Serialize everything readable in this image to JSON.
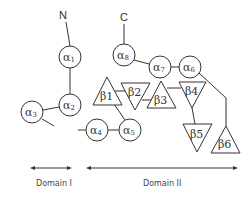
{
  "diagram": {
    "type": "protein-topology",
    "termini": {
      "n": "N",
      "c": "C"
    },
    "helices": [
      {
        "id": "a1",
        "label": "α",
        "sub": "1",
        "cx": 70,
        "cy": 57
      },
      {
        "id": "a2",
        "label": "α",
        "sub": "2",
        "cx": 70,
        "cy": 105
      },
      {
        "id": "a3",
        "label": "α",
        "sub": "3",
        "cx": 32,
        "cy": 112
      },
      {
        "id": "a4",
        "label": "α",
        "sub": "4",
        "cx": 97,
        "cy": 130
      },
      {
        "id": "a5",
        "label": "α",
        "sub": "5",
        "cx": 130,
        "cy": 130
      },
      {
        "id": "a6",
        "label": "α",
        "sub": "6",
        "cx": 190,
        "cy": 67
      },
      {
        "id": "a7",
        "label": "α",
        "sub": "7",
        "cx": 160,
        "cy": 67
      },
      {
        "id": "a8",
        "label": "α",
        "sub": "8",
        "cx": 124,
        "cy": 55
      }
    ],
    "strands": [
      {
        "id": "b1",
        "label": "β1",
        "direction": "up"
      },
      {
        "id": "b2",
        "label": "β2",
        "direction": "down"
      },
      {
        "id": "b3",
        "label": "β3",
        "direction": "up"
      },
      {
        "id": "b4",
        "label": "β4",
        "direction": "down"
      },
      {
        "id": "b5",
        "label": "β5",
        "direction": "down"
      },
      {
        "id": "b6",
        "label": "β6",
        "direction": "up"
      }
    ],
    "domains": [
      {
        "id": "domain1",
        "label": "Domain I"
      },
      {
        "id": "domain2",
        "label": "Domain II"
      }
    ],
    "colors": {
      "line": "#333333",
      "background": "#ffffff"
    }
  }
}
